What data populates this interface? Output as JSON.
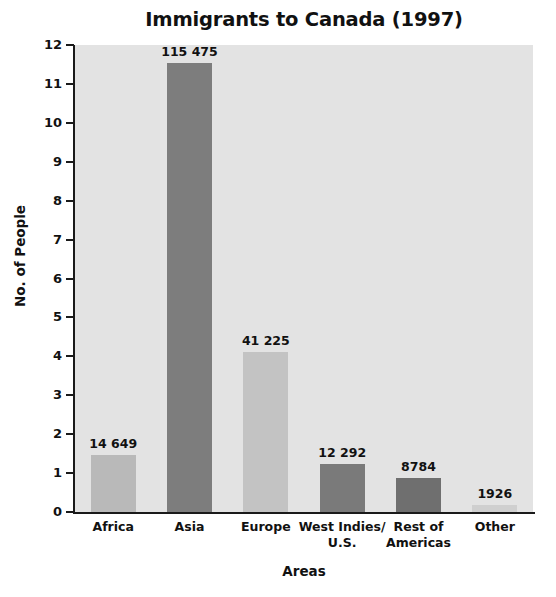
{
  "chart_data": {
    "type": "bar",
    "title": "Immigrants to Canada (1997)",
    "xlabel": "Areas",
    "ylabel": "No. of People",
    "categories": [
      "Africa",
      "Asia",
      "Europe",
      "West Indies/ U.S.",
      "Rest of Americas",
      "Other"
    ],
    "category_lines": [
      [
        "Africa"
      ],
      [
        "Asia"
      ],
      [
        "Europe"
      ],
      [
        "West Indies/",
        "U.S."
      ],
      [
        "Rest of",
        "Americas"
      ],
      [
        "Other"
      ]
    ],
    "values": [
      14649,
      115475,
      41225,
      12292,
      8784,
      1926
    ],
    "value_labels": [
      "14 649",
      "115 475",
      "41 225",
      "12 292",
      "8784",
      "1926"
    ],
    "bar_colors": [
      "#b9b9b9",
      "#7d7d7d",
      "#c3c3c3",
      "#7a7a7a",
      "#6f6f6f",
      "#cfcfcf"
    ],
    "y_tick_labels": [
      "12",
      "11",
      "10",
      "9",
      "8",
      "7",
      "6",
      "5",
      "4",
      "3",
      "2",
      "1",
      "0"
    ],
    "y_tick_values": [
      12,
      11,
      10,
      9,
      8,
      7,
      6,
      5,
      4,
      3,
      2,
      1,
      0
    ],
    "ylim": [
      0,
      12
    ],
    "y_axis_scale_note": "axis counts in units of 10 000 people",
    "grid": false,
    "legend": "none",
    "plot_background": "#e3e3e3",
    "axis_color": "#1a1a1a",
    "text_color": "#111111"
  }
}
